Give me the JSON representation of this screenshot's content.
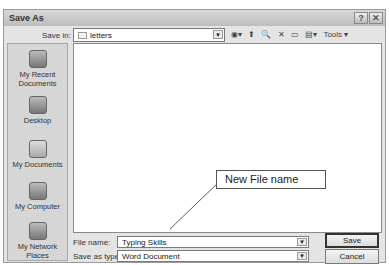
{
  "window": {
    "title": "Save As",
    "help_btn": "?",
    "close_btn": "✕"
  },
  "save_in": {
    "label": "Save in:",
    "value": "letters"
  },
  "toolbar": {
    "back_icon": "◉▾",
    "up_icon": "⬆",
    "search_icon": "🔍",
    "delete_icon": "✕",
    "new_folder_icon": "▭",
    "views_icon": "▤▾",
    "tools_label": "Tools ▾"
  },
  "places": [
    {
      "label_line1": "My Recent",
      "label_line2": "Documents"
    },
    {
      "label_line1": "Desktop",
      "label_line2": ""
    },
    {
      "label_line1": "My Documents",
      "label_line2": ""
    },
    {
      "label_line1": "My Computer",
      "label_line2": ""
    },
    {
      "label_line1": "My Network",
      "label_line2": "Places"
    }
  ],
  "file_name": {
    "label": "File name:",
    "value": "Typing Skills"
  },
  "save_as_type": {
    "label": "Save as type:",
    "value": "Word Document"
  },
  "buttons": {
    "save": "Save",
    "cancel": "Cancel"
  },
  "annotation": {
    "text": "New File name"
  }
}
